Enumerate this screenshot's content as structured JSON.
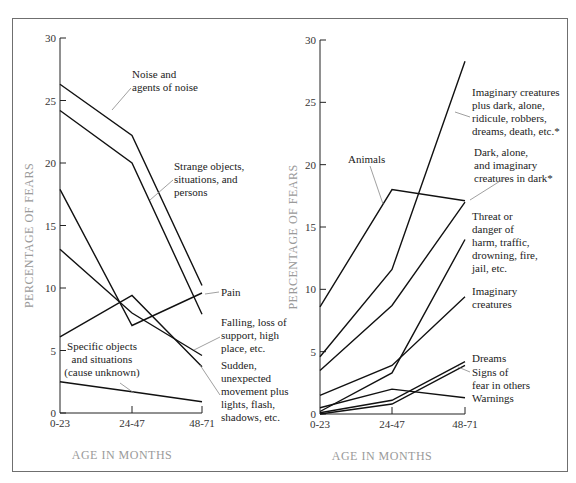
{
  "chart_data": [
    {
      "type": "line",
      "panel": "left",
      "title": "",
      "xlabel": "AGE IN MONTHS",
      "ylabel": "PERCENTAGE OF FEARS",
      "categories": [
        "0-23",
        "24-47",
        "48-71"
      ],
      "yticks": [
        0,
        5,
        10,
        15,
        20,
        25,
        30
      ],
      "ylim": [
        0,
        30
      ],
      "grid": false,
      "legend": "inline labels",
      "series": [
        {
          "name": "Noise and agents of noise",
          "values": [
            26.3,
            22.2,
            10.2
          ]
        },
        {
          "name": "Strange objects, situations, and persons",
          "values": [
            24.2,
            20.0,
            7.9
          ]
        },
        {
          "name": "Pain",
          "values": [
            17.9,
            7.0,
            9.6
          ]
        },
        {
          "name": "Falling, loss of support, high place, etc.",
          "values": [
            13.1,
            8.0,
            4.6
          ]
        },
        {
          "name": "Sudden, unexpected movement plus lights, flash, shadows, etc.",
          "values": [
            6.1,
            9.4,
            3.7
          ]
        },
        {
          "name": "Specific objects and situations (cause unknown)",
          "values": [
            2.5,
            1.7,
            0.9
          ]
        }
      ]
    },
    {
      "type": "line",
      "panel": "right",
      "title": "",
      "xlabel": "AGE IN MONTHS",
      "ylabel": "PERCENTAGE OF FEARS",
      "categories": [
        "0-23",
        "24-47",
        "48-71"
      ],
      "yticks": [
        0,
        5,
        10,
        15,
        20,
        25,
        30
      ],
      "ylim": [
        0,
        30
      ],
      "grid": false,
      "legend": "inline labels",
      "series": [
        {
          "name": "Imaginary creatures plus dark, alone, ridicule, robbers, dreams, death, etc.*",
          "values": [
            4.6,
            11.6,
            28.3
          ]
        },
        {
          "name": "Dark, alone, and imaginary creatures in dark*",
          "values": [
            3.5,
            8.7,
            17.0
          ]
        },
        {
          "name": "Animals",
          "values": [
            8.6,
            18.0,
            17.1
          ]
        },
        {
          "name": "Threat or danger of harm, traffic, drowning, fire, jail, etc.",
          "values": [
            0.2,
            3.3,
            14.0
          ]
        },
        {
          "name": "Imaginary creatures",
          "values": [
            1.5,
            3.9,
            9.4
          ]
        },
        {
          "name": "Dreams",
          "values": [
            0.1,
            1.1,
            4.2
          ]
        },
        {
          "name": "Signs of fear in others",
          "values": [
            0.0,
            0.8,
            3.9
          ]
        },
        {
          "name": "Warnings",
          "values": [
            0.5,
            2.0,
            1.3
          ]
        }
      ]
    }
  ],
  "left": {
    "xlabel": "AGE IN MONTHS",
    "ylabel": "PERCENTAGE OF FEARS",
    "xticks": [
      "0-23",
      "24-47",
      "48-71"
    ],
    "yticks": [
      "0",
      "5",
      "10",
      "15",
      "20",
      "25",
      "30"
    ],
    "labels": {
      "noise": [
        "Noise and",
        "agents of noise"
      ],
      "strange": [
        "Strange objects,",
        "situations, and",
        "persons"
      ],
      "pain": [
        "Pain"
      ],
      "falling": [
        "Falling, loss of",
        "support, high",
        "place, etc."
      ],
      "sudden": [
        "Sudden,",
        "unexpected",
        "movement plus",
        "lights, flash,",
        "shadows, etc."
      ],
      "specific": [
        "Specific objects",
        "and situations",
        "(cause unknown)"
      ]
    }
  },
  "right": {
    "xlabel": "AGE IN MONTHS",
    "ylabel": "PERCENTAGE OF FEARS",
    "xticks": [
      "0-23",
      "24-47",
      "48-71"
    ],
    "yticks": [
      "0",
      "5",
      "10",
      "15",
      "20",
      "25",
      "30"
    ],
    "labels": {
      "imagplus": [
        "Imaginary creatures",
        "plus dark, alone,",
        "ridicule, robbers,",
        "dreams, death, etc.*"
      ],
      "dark": [
        "Dark, alone,",
        "and imaginary",
        "creatures in dark*"
      ],
      "animals": [
        "Animals"
      ],
      "threat": [
        "Threat or",
        "danger of",
        "harm, traffic,",
        "drowning, fire,",
        "jail, etc."
      ],
      "imag": [
        "Imaginary",
        "creatures"
      ],
      "dreams": [
        "Dreams"
      ],
      "signs": [
        "Signs of",
        "fear in others"
      ],
      "warnings": [
        "Warnings"
      ]
    }
  }
}
